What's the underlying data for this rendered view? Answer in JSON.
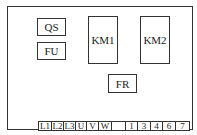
{
  "diagram": {
    "type": "electrical-panel-layout",
    "components": [
      {
        "id": "QS",
        "label": "QS"
      },
      {
        "id": "FU",
        "label": "FU"
      },
      {
        "id": "KM1",
        "label": "KM1"
      },
      {
        "id": "KM2",
        "label": "KM2"
      },
      {
        "id": "FR",
        "label": "FR"
      }
    ],
    "terminal_strip": {
      "terminals": [
        "L1",
        "L2",
        "L3",
        "U",
        "V",
        "W",
        "",
        "1",
        "3",
        "4",
        "6",
        "7"
      ]
    }
  }
}
